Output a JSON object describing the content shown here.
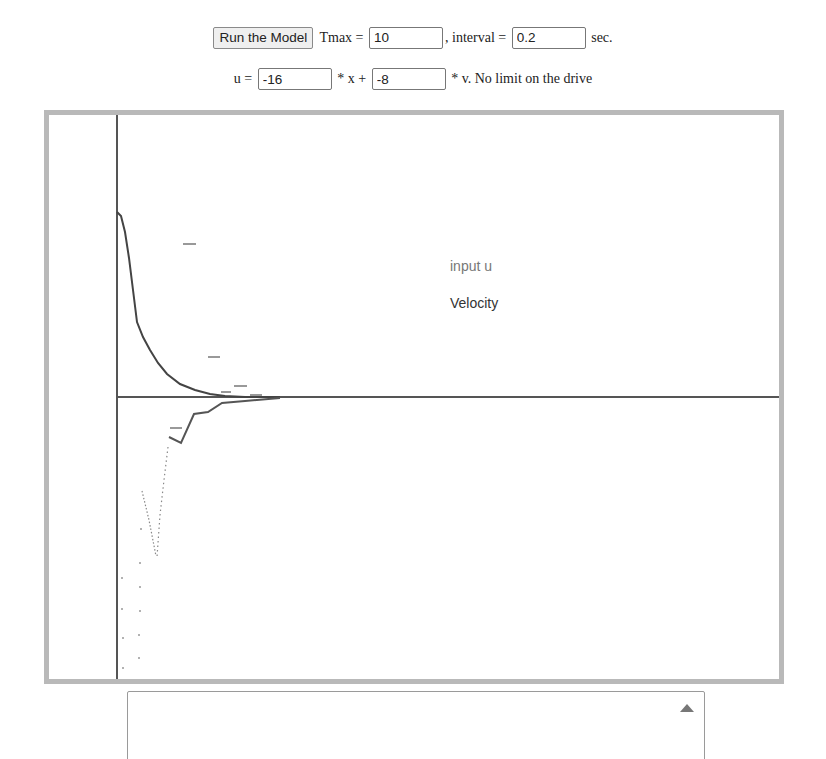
{
  "controls": {
    "run_button": "Run the Model",
    "tmax_label": " Tmax = ",
    "tmax_value": "10",
    "interval_label": ", interval = ",
    "interval_value": "0.2",
    "interval_unit": " sec.",
    "u_label": "u = ",
    "x_gain_value": "-16",
    "x_label": " * x + ",
    "v_gain_value": "-8",
    "v_label": " * v. No limit on the drive"
  },
  "plot": {
    "legend": [
      {
        "label": "input u",
        "color": "#777777"
      },
      {
        "label": "Velocity",
        "color": "#333333"
      }
    ],
    "axis_color": "#555555",
    "border_color": "#b9b9b9"
  },
  "console": {
    "value": "",
    "scroll_icon": "triangle-up"
  }
}
